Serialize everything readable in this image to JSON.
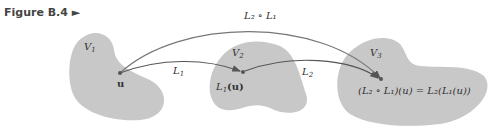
{
  "figure": {
    "label": "Figure B.4",
    "marker": "►"
  },
  "sets": [
    {
      "name": "V1",
      "label": "V",
      "sub": "1",
      "fill": "#c8c8c8"
    },
    {
      "name": "V2",
      "label": "V",
      "sub": "2",
      "fill": "#c8c8c8"
    },
    {
      "name": "V3",
      "label": "V",
      "sub": "3",
      "fill": "#c8c8c8"
    }
  ],
  "points": {
    "u": "u",
    "l1u_prefix": "L",
    "l1u_sub": "1",
    "l1u_arg": "(u)",
    "result": "(L₂ ∘ L₁)(u) = L₂(L₁(u))"
  },
  "arrows": {
    "l1": {
      "label": "L",
      "sub": "1"
    },
    "l2": {
      "label": "L",
      "sub": "2"
    },
    "composite": {
      "label": "L₂ ∘ L₁"
    }
  },
  "colors": {
    "blob": "#c8c8c8",
    "arrow": "#555555",
    "text": "#333333"
  }
}
